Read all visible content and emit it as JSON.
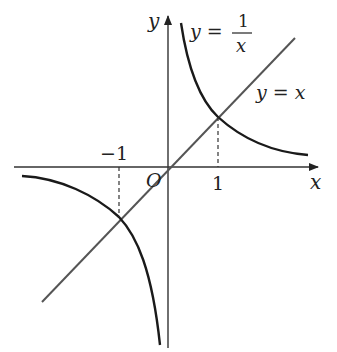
{
  "diagram": {
    "axes": {
      "x_label": "x",
      "y_label": "y",
      "origin_label": "O"
    },
    "ticks": {
      "neg_one": "−1",
      "pos_one": "1"
    },
    "curves": {
      "hyperbola": {
        "label_lhs": "y =",
        "label_num": "1",
        "label_den": "x"
      },
      "line": {
        "label": "y = x"
      }
    },
    "intersections": [
      [
        1,
        1
      ],
      [
        -1,
        -1
      ]
    ],
    "colors": {
      "curve": "#1a1a1a",
      "line": "#555555",
      "axis": "#333333"
    }
  }
}
